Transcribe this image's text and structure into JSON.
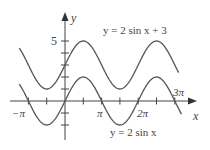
{
  "chart_data": {
    "type": "line",
    "title": "",
    "xlabel": "x",
    "ylabel": "y",
    "xlim": [
      -3.77,
      9.7
    ],
    "ylim": [
      -2.5,
      5.8
    ],
    "x_tick_labels": [
      "−π",
      "π",
      "2π",
      "3π"
    ],
    "x_tick_values": [
      -3.1416,
      3.1416,
      6.2832,
      9.4248
    ],
    "x_minor_ticks_every": "π/2",
    "y_tick_labels": [
      "5"
    ],
    "y_tick_values": [
      -2,
      -1,
      1,
      2,
      3,
      4,
      5
    ],
    "grid": false,
    "series": [
      {
        "name": "y = 2 sin x + 3",
        "formula": "2*sin(x)+3",
        "x_range": [
          -3.92,
          9.75
        ],
        "min": 1,
        "max": 5
      },
      {
        "name": "y = 2 sin x",
        "formula": "2*sin(x)",
        "x_range": [
          -3.92,
          10.0
        ],
        "min": -2,
        "max": 2
      }
    ],
    "annotations": [
      {
        "text": "y = 2 sin x + 3",
        "near": "upper curve, top right"
      },
      {
        "text": "y = 2 sin x",
        "near": "lower curve, bottom"
      }
    ]
  },
  "labels": {
    "y_axis": "y",
    "x_axis": "x",
    "five": "5",
    "neg_pi": "−π",
    "pi": "π",
    "two_pi": "2π",
    "three_pi": "3π",
    "upper_curve": "y = 2 sin x + 3",
    "lower_curve": "y = 2 sin x"
  }
}
